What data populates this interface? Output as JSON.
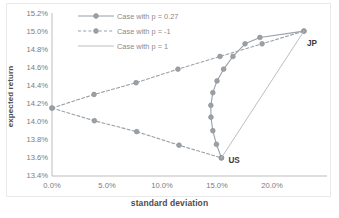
{
  "chart_data": {
    "type": "line",
    "title": "",
    "xlabel": "standard deviation",
    "ylabel": "expected return",
    "xlim": [
      0.0,
      25.0
    ],
    "ylim": [
      13.4,
      15.2
    ],
    "xtick_labels": [
      "0.0%",
      "5.0%",
      "10.0%",
      "15.0%",
      "20.0%"
    ],
    "xtick_values": [
      0.0,
      5.0,
      10.0,
      15.0,
      20.0
    ],
    "ytick_labels": [
      "13.4%",
      "13.6%",
      "13.8%",
      "14.0%",
      "14.2%",
      "14.4%",
      "14.6%",
      "14.8%",
      "15.0%",
      "15.2%"
    ],
    "ytick_values": [
      13.4,
      13.6,
      13.8,
      14.0,
      14.2,
      14.4,
      14.6,
      14.8,
      15.0,
      15.2
    ],
    "grid": false,
    "legend_position": "top-left",
    "series": [
      {
        "name": "Case with p = 0.27",
        "style": "solid-markers",
        "color": "#9aa0a6",
        "points": [
          {
            "x": 15.4,
            "y": 13.6
          },
          {
            "x": 14.95,
            "y": 13.75
          },
          {
            "x": 14.62,
            "y": 13.9
          },
          {
            "x": 14.45,
            "y": 14.05
          },
          {
            "x": 14.44,
            "y": 14.18
          },
          {
            "x": 14.62,
            "y": 14.32
          },
          {
            "x": 15.0,
            "y": 14.45
          },
          {
            "x": 15.6,
            "y": 14.58
          },
          {
            "x": 16.45,
            "y": 14.72
          },
          {
            "x": 17.55,
            "y": 14.86
          },
          {
            "x": 18.9,
            "y": 14.93
          },
          {
            "x": 22.9,
            "y": 15.0
          }
        ]
      },
      {
        "name": "Case with p = -1",
        "style": "dashed-markers",
        "color": "#9aa0a6",
        "points": [
          {
            "x": 0.0,
            "y": 14.15
          },
          {
            "x": 3.82,
            "y": 14.3
          },
          {
            "x": 7.64,
            "y": 14.43
          },
          {
            "x": 11.45,
            "y": 14.58
          },
          {
            "x": 15.27,
            "y": 14.72
          },
          {
            "x": 19.1,
            "y": 14.86
          },
          {
            "x": 22.9,
            "y": 15.0
          }
        ]
      },
      {
        "name": "Case with p = -1 (lower branch)",
        "style": "dashed-markers",
        "color": "#9aa0a6",
        "points": [
          {
            "x": 0.0,
            "y": 14.15
          },
          {
            "x": 3.85,
            "y": 14.01
          },
          {
            "x": 7.7,
            "y": 13.89
          },
          {
            "x": 11.55,
            "y": 13.74
          },
          {
            "x": 15.4,
            "y": 13.6
          }
        ]
      },
      {
        "name": "Case with p = 1",
        "style": "solid-plain",
        "color": "#b3b7bb",
        "points": [
          {
            "x": 15.4,
            "y": 13.6
          },
          {
            "x": 22.9,
            "y": 15.0
          }
        ]
      }
    ],
    "annotations": [
      {
        "label": "US",
        "x": 15.4,
        "y": 13.6
      },
      {
        "label": "JP",
        "x": 22.9,
        "y": 15.0
      }
    ],
    "legend": [
      {
        "label": "Case with p = 0.27",
        "style": "solid-markers"
      },
      {
        "label": "Case with p = -1",
        "style": "dashed-markers"
      },
      {
        "label": "Case with p = 1",
        "style": "solid-plain"
      }
    ]
  }
}
